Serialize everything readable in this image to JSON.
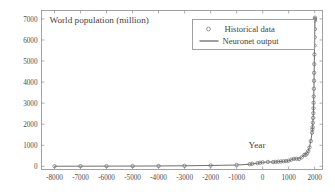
{
  "chart_data": {
    "type": "scatter",
    "title": "",
    "ylabel_inline": "World population (million)",
    "xlabel": "Year",
    "xlim": [
      -8500,
      2300
    ],
    "ylim": [
      -150,
      7400
    ],
    "grid": false,
    "legend_position": "top-right",
    "x_ticks": [
      -8000,
      -7000,
      -6000,
      -5000,
      -4000,
      -3000,
      -2000,
      -1000,
      0,
      1000,
      2000
    ],
    "x_tick_labels": [
      "-8000",
      "-7000",
      "-6000",
      "-5000",
      "-4000",
      "-3000",
      "-2000",
      "-1000",
      "0",
      "1000",
      "2000"
    ],
    "y_ticks": [
      0,
      1000,
      2000,
      3000,
      4000,
      5000,
      6000,
      7000
    ],
    "y_tick_labels": [
      "0",
      "1000",
      "2000",
      "3000",
      "4000",
      "5000",
      "6000",
      "7000"
    ],
    "series": [
      {
        "name": "Historical data",
        "marker": "circle-open",
        "color": "#6b6b6b",
        "points": [
          [
            -8000,
            5
          ],
          [
            -7000,
            7
          ],
          [
            -6000,
            9
          ],
          [
            -5000,
            12
          ],
          [
            -4000,
            18
          ],
          [
            -3000,
            25
          ],
          [
            -2000,
            40
          ],
          [
            -1000,
            60
          ],
          [
            -500,
            100
          ],
          [
            -400,
            120
          ],
          [
            -200,
            150
          ],
          [
            -100,
            170
          ],
          [
            0,
            190
          ],
          [
            200,
            210
          ],
          [
            400,
            200
          ],
          [
            500,
            210
          ],
          [
            600,
            220
          ],
          [
            700,
            230
          ],
          [
            800,
            240
          ],
          [
            900,
            250
          ],
          [
            1000,
            265
          ],
          [
            1100,
            320
          ],
          [
            1200,
            360
          ],
          [
            1300,
            360
          ],
          [
            1400,
            350
          ],
          [
            1500,
            425
          ],
          [
            1600,
            545
          ],
          [
            1650,
            545
          ],
          [
            1700,
            610
          ],
          [
            1750,
            720
          ],
          [
            1800,
            900
          ],
          [
            1850,
            1200
          ],
          [
            1900,
            1600
          ],
          [
            1910,
            1750
          ],
          [
            1920,
            1860
          ],
          [
            1930,
            2070
          ],
          [
            1940,
            2300
          ],
          [
            1950,
            2525
          ],
          [
            1955,
            2758
          ],
          [
            1960,
            3018
          ],
          [
            1965,
            3322
          ],
          [
            1970,
            3682
          ],
          [
            1975,
            4061
          ],
          [
            1980,
            4440
          ],
          [
            1985,
            4853
          ],
          [
            1990,
            5310
          ],
          [
            1995,
            5735
          ],
          [
            2000,
            6127
          ],
          [
            2005,
            6520
          ],
          [
            2010,
            6930
          ],
          [
            2011,
            7000
          ],
          [
            2012,
            7060
          ]
        ]
      },
      {
        "name": "Neuronet output",
        "marker": "line",
        "color": "#6e6e6e",
        "points": [
          [
            -8000,
            5
          ],
          [
            -7000,
            8
          ],
          [
            -6000,
            10
          ],
          [
            -5000,
            13
          ],
          [
            -4000,
            19
          ],
          [
            -3000,
            27
          ],
          [
            -2000,
            42
          ],
          [
            -1000,
            62
          ],
          [
            -500,
            100
          ],
          [
            -200,
            150
          ],
          [
            0,
            190
          ],
          [
            200,
            208
          ],
          [
            400,
            202
          ],
          [
            600,
            220
          ],
          [
            800,
            240
          ],
          [
            1000,
            265
          ],
          [
            1200,
            358
          ],
          [
            1400,
            352
          ],
          [
            1500,
            428
          ],
          [
            1600,
            545
          ],
          [
            1700,
            612
          ],
          [
            1750,
            722
          ],
          [
            1800,
            902
          ],
          [
            1850,
            1200
          ],
          [
            1900,
            1605
          ],
          [
            1920,
            1862
          ],
          [
            1940,
            2302
          ],
          [
            1950,
            2528
          ],
          [
            1960,
            3020
          ],
          [
            1970,
            3684
          ],
          [
            1980,
            4442
          ],
          [
            1990,
            5312
          ],
          [
            2000,
            6128
          ],
          [
            2010,
            6932
          ],
          [
            2012,
            7060
          ]
        ]
      }
    ],
    "legend": [
      {
        "label": "Historical data",
        "style": "marker"
      },
      {
        "label": "Neuronet output",
        "style": "line"
      }
    ]
  }
}
